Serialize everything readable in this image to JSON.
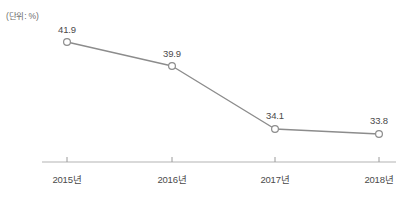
{
  "chart_data": {
    "type": "line",
    "title": "",
    "subtitle": "",
    "unit_label": "(단위: %)",
    "xlabel": "",
    "ylabel": "",
    "categories": [
      "2015년",
      "2016년",
      "2017년",
      "2018년"
    ],
    "values": [
      41.9,
      39.9,
      34.1,
      33.8
    ],
    "value_labels": [
      "41.9",
      "39.9",
      "34.1",
      "33.8"
    ],
    "series": [
      {
        "name": "",
        "values": [
          41.9,
          39.9,
          34.1,
          33.8
        ]
      }
    ],
    "ylim": [
      30.0,
      44.0
    ],
    "grid": false,
    "legend": false,
    "legend_position": "none",
    "colors": {
      "line": "#8c8c8c",
      "marker_fill": "#ffffff",
      "marker_stroke": "#8c8c8c",
      "axis": "#b3b3b3",
      "tick": "#9a9a9a",
      "text": "#4a4a4a",
      "unit_text": "#6e6e6e",
      "background": "#ffffff"
    }
  },
  "points": [
    {
      "label": "41.9",
      "category": "2015년",
      "px": 67,
      "py": 42,
      "label_x": 67,
      "label_y": 24
    },
    {
      "label": "39.9",
      "category": "2016년",
      "px": 172,
      "py": 66,
      "label_x": 172,
      "label_y": 48
    },
    {
      "label": "34.1",
      "category": "2017년",
      "px": 275,
      "py": 129,
      "label_x": 275,
      "label_y": 110
    },
    {
      "label": "33.8",
      "category": "2018년",
      "px": 379,
      "py": 134,
      "label_x": 379,
      "label_y": 115
    }
  ],
  "axis": {
    "line_start_x": 42,
    "line_end_x": 396,
    "line_y": 162,
    "tick_positions": [
      67,
      172,
      275,
      379
    ],
    "tick_height": 5
  }
}
